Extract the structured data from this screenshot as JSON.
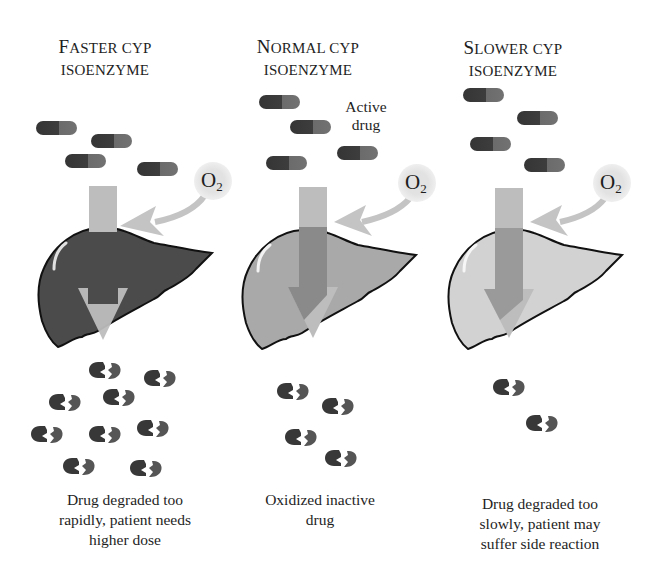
{
  "figure": {
    "panels": [
      {
        "id": "faster",
        "heading_line1_cap": "F",
        "heading_line1_rest": "ASTER CYP",
        "heading_line2": "ISOENZYME",
        "liver_color": "#4d4d4d",
        "active_drug_count": 4,
        "metabolite_count": 10,
        "oxygen_label": "O",
        "oxygen_subscript": "2",
        "caption_lines": [
          "Drug degraded too",
          "rapidly, patient needs",
          "higher dose"
        ]
      },
      {
        "id": "normal",
        "heading_line1_cap": "N",
        "heading_line1_rest": "ORMAL CYP",
        "heading_line2": "ISOENZYME",
        "liver_color": "#a6a6a6",
        "active_drug_count": 4,
        "metabolite_count": 4,
        "oxygen_label": "O",
        "oxygen_subscript": "2",
        "active_drug_label_line1": "Active",
        "active_drug_label_line2": "drug",
        "caption_lines": [
          "Oxidized inactive",
          "drug"
        ]
      },
      {
        "id": "slower",
        "heading_line1_cap": "S",
        "heading_line1_rest": "LOWER CYP",
        "heading_line2": "ISOENZYME",
        "liver_color": "#cfcfcf",
        "active_drug_count": 4,
        "metabolite_count": 2,
        "oxygen_label": "O",
        "oxygen_subscript": "2",
        "caption_lines": [
          "Drug degraded too",
          "slowly, patient may",
          "suffer side reaction"
        ]
      }
    ],
    "colors": {
      "capsule_dark": "#3a3a3a",
      "capsule_light": "#6a6a6a",
      "arrow": "#bdbdbd",
      "arrow_overlap": "#8e8e8e",
      "o2_circle": "#e4e4e4",
      "metabolite": "#3c3c3c",
      "outline": "#111111"
    }
  }
}
